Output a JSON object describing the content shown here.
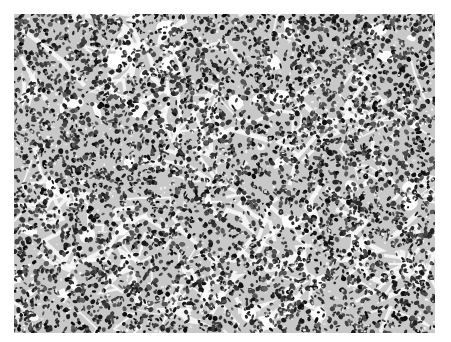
{
  "image": {
    "kind": "histology micrograph",
    "description": "Grayscale micrograph of densely packed dark-staining cell nuclei in sheets separated by pale fibrous stroma",
    "colors": {
      "background": "#ffffff",
      "nuclei": "#1a1a1a",
      "stroma": "#f2f2f2",
      "mid": "#7a7a7a"
    },
    "bounds": {
      "left": 14,
      "top": 14,
      "width": 421,
      "height": 319
    }
  }
}
